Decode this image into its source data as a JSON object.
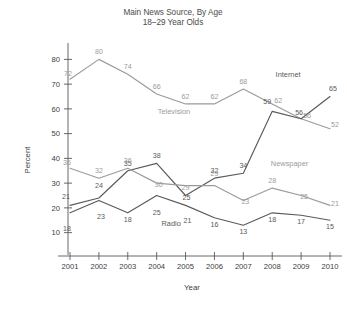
{
  "chart_data": {
    "type": "line",
    "title": "Main News Source, By Age",
    "subtitle": "18–29 Year Olds",
    "xlabel": "Year",
    "ylabel": "Percent",
    "categories": [
      "2001",
      "2002",
      "2003",
      "2004",
      "2005",
      "2006",
      "2007",
      "2008",
      "2009",
      "2010"
    ],
    "x": [
      2001,
      2002,
      2003,
      2004,
      2005,
      2006,
      2007,
      2008,
      2009,
      2010
    ],
    "xlim": [
      2001,
      2010
    ],
    "ylim": [
      5,
      85
    ],
    "yticks": [
      10,
      20,
      30,
      40,
      50,
      60,
      70,
      80
    ],
    "grid": false,
    "legend_position": "inline-labels",
    "series": [
      {
        "name": "Television",
        "color": "#9b9b9b",
        "values": [
          72,
          80,
          74,
          66,
          62,
          62,
          68,
          62,
          56,
          52
        ],
        "label_x": 2004.6,
        "label_y": 58
      },
      {
        "name": "Internet",
        "color": "#5a5a5a",
        "values": [
          21,
          24,
          35,
          38,
          25,
          32,
          34,
          59,
          56,
          65
        ],
        "label_x": 2008.55,
        "label_y": 73
      },
      {
        "name": "Newspaper",
        "color": "#9b9b9b",
        "values": [
          36,
          32,
          36,
          30,
          29,
          29,
          23,
          28,
          25,
          21
        ],
        "label_x": 2008.6,
        "label_y": 37
      },
      {
        "name": "Radio",
        "color": "#5a5a5a",
        "values": [
          18,
          23,
          18,
          25,
          21,
          16,
          13,
          18,
          17,
          15
        ],
        "label_x": 2004.5,
        "label_y": 12.5
      }
    ],
    "annotations": {
      "Television": [
        "72",
        "80",
        "74",
        "66",
        "62",
        "62",
        "68",
        "62",
        "56",
        "52"
      ],
      "Internet": [
        "21",
        "24",
        "35",
        "38",
        "25",
        "32",
        "34",
        "59",
        "56",
        "65"
      ],
      "Newspaper": [
        "36",
        "32",
        "36",
        "30",
        "29",
        "29",
        "23",
        "28",
        "25",
        "21"
      ],
      "Radio": [
        "18",
        "23",
        "18",
        "25",
        "21",
        "16",
        "13",
        "18",
        "17",
        "15"
      ]
    }
  }
}
